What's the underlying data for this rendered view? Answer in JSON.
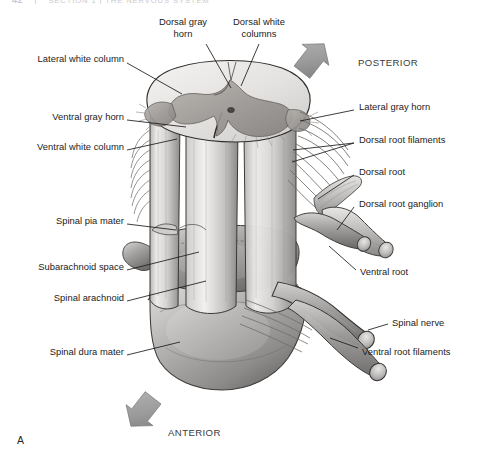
{
  "figure": {
    "panel_letter": "A",
    "background_color": "#ffffff",
    "ink_color": "#1b1b1b",
    "arrow_color": "#9a9a9a"
  },
  "running_head": {
    "page_number": "42",
    "separator": "|",
    "title": "SECTION 1 | THE NERVOUS SYSTEM"
  },
  "directions": [
    {
      "id": "posterior",
      "label": "POSTERIOR",
      "arrow": "arrow-up-right",
      "text_x": 358,
      "text_y": 57,
      "arrow_x": 302,
      "arrow_y": 44
    },
    {
      "id": "anterior",
      "label": "ANTERIOR",
      "arrow": "arrow-down-left",
      "text_x": 168,
      "text_y": 430,
      "arrow_x": 133,
      "arrow_y": 408
    }
  ],
  "labels": [
    {
      "id": "dorsal-gray-horn",
      "text": "Dorsal gray\nhorn",
      "line1": "Dorsal gray",
      "line2": "horn",
      "side": "top",
      "text_x": 163,
      "text_y": 18,
      "leader": [
        [
          206,
          44
        ],
        [
          231,
          88
        ]
      ]
    },
    {
      "id": "dorsal-white-columns",
      "text": "Dorsal white\ncolumns",
      "line1": "Dorsal white",
      "line2": "columns",
      "side": "top",
      "text_x": 231,
      "text_y": 18,
      "leader": [
        [
          259,
          44
        ],
        [
          241,
          86
        ]
      ]
    },
    {
      "id": "lateral-white-column",
      "text": "Lateral white column",
      "side": "left",
      "text_x": 22,
      "text_y": 58,
      "leader": [
        [
          127,
          63
        ],
        [
          182,
          94
        ]
      ]
    },
    {
      "id": "ventral-gray-horn",
      "text": "Ventral gray horn",
      "side": "left",
      "text_x": 39,
      "text_y": 116,
      "leader": [
        [
          127,
          120
        ],
        [
          186,
          127
        ]
      ]
    },
    {
      "id": "ventral-white-column",
      "text": "Ventral white column",
      "side": "left",
      "text_x": 22,
      "text_y": 146,
      "leader": [
        [
          127,
          150
        ],
        [
          177,
          139
        ]
      ]
    },
    {
      "id": "spinal-pia-mater",
      "text": "Spinal pia mater",
      "side": "left",
      "text_x": 44,
      "text_y": 220,
      "leader": [
        [
          127,
          224
        ],
        [
          176,
          230
        ]
      ]
    },
    {
      "id": "subarachnoid-space",
      "text": "Subarachnoid space",
      "side": "left",
      "text_x": 22,
      "text_y": 266,
      "leader": [
        [
          127,
          270
        ],
        [
          199,
          252
        ]
      ]
    },
    {
      "id": "spinal-arachnoid",
      "text": "Spinal arachnoid",
      "side": "left",
      "text_x": 40,
      "text_y": 297,
      "leader": [
        [
          127,
          301
        ],
        [
          206,
          281
        ]
      ]
    },
    {
      "id": "spinal-dura-mater",
      "text": "Spinal dura mater",
      "side": "left",
      "text_x": 36,
      "text_y": 351,
      "leader": [
        [
          127,
          355
        ],
        [
          180,
          342
        ]
      ]
    },
    {
      "id": "lateral-gray-horn",
      "text": "Lateral gray horn",
      "side": "right",
      "text_x": 359,
      "text_y": 106,
      "leader": [
        [
          354,
          110
        ],
        [
          300,
          121
        ]
      ]
    },
    {
      "id": "dorsal-root-filaments",
      "text": "Dorsal root filaments",
      "side": "right",
      "text_x": 359,
      "text_y": 139,
      "leader": [
        [
          354,
          143
        ],
        [
          293,
          150
        ]
      ]
    },
    {
      "id": "dorsal-root",
      "text": "Dorsal root",
      "side": "right",
      "text_x": 359,
      "text_y": 171,
      "leader": [
        [
          354,
          175
        ],
        [
          318,
          199
        ]
      ]
    },
    {
      "id": "dorsal-root-ganglion",
      "text": "Dorsal root ganglion",
      "side": "right",
      "text_x": 359,
      "text_y": 203,
      "leader": [
        [
          354,
          207
        ],
        [
          337,
          230
        ]
      ]
    },
    {
      "id": "ventral-root",
      "text": "Ventral root",
      "side": "right",
      "text_x": 360,
      "text_y": 272,
      "leader": [
        [
          356,
          272
        ],
        [
          329,
          246
        ]
      ]
    },
    {
      "id": "spinal-nerve",
      "text": "Spinal nerve",
      "side": "right",
      "text_x": 392,
      "text_y": 322,
      "leader": [
        [
          388,
          326
        ],
        [
          368,
          330
        ]
      ]
    },
    {
      "id": "ventral-root-filaments",
      "text": "Ventral root filaments",
      "side": "right",
      "text_x": 362,
      "text_y": 352,
      "leader": [
        [
          358,
          350
        ],
        [
          330,
          338
        ]
      ]
    }
  ],
  "illustration": {
    "description": "Three-dimensional drawing of a segment of the spinal cord cut transversely at the top, showing the butterfly-shaped gray matter surrounded by white columns, with dorsal and ventral root filaments converging into roots, a dorsal root ganglion, and the spinal nerve, enclosed by pia, arachnoid and dura mater sheaths.",
    "structures": [
      "spinal cord segment",
      "transverse cut surface",
      "gray matter butterfly",
      "dorsal gray horn",
      "ventral gray horn",
      "lateral gray horn",
      "central canal",
      "dorsal white column",
      "lateral white column",
      "ventral white column",
      "dorsal root filaments",
      "ventral root filaments",
      "dorsal root",
      "ventral root",
      "dorsal root ganglion",
      "spinal nerve",
      "spinal pia mater",
      "spinal arachnoid",
      "spinal dura mater",
      "subarachnoid space",
      "denticulate ligament"
    ]
  }
}
